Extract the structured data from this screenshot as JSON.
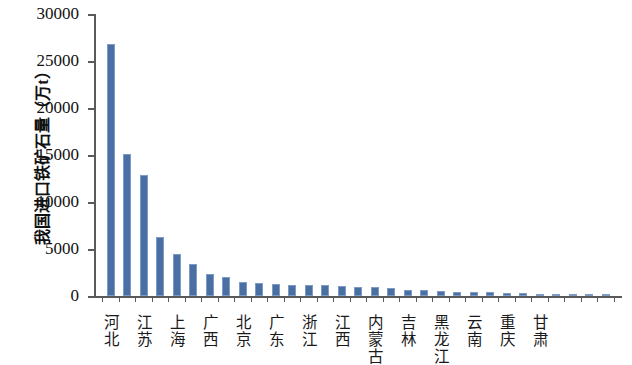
{
  "chart_data": {
    "type": "bar",
    "title": "",
    "xlabel": "",
    "ylabel": "我国进口铁矿石量（万t）",
    "ylim": [
      0,
      30000
    ],
    "ytick_values": [
      0,
      5000,
      10000,
      15000,
      20000,
      25000,
      30000
    ],
    "ytick_labels": [
      "0",
      "5000",
      "10000",
      "15000",
      "20000",
      "25000",
      "30000"
    ],
    "grid": false,
    "legend": null,
    "bar_color": "#4a6fa5",
    "bar_edge_color": "#7e9bc4",
    "axis_color": "#5a5a5a",
    "categories": [
      "河北",
      "辽宁",
      "江苏",
      "山东",
      "上海",
      "天津",
      "广西",
      "福建",
      "北京",
      "湖北",
      "广东",
      "安徽",
      "浙江",
      "山西",
      "江西",
      "河南",
      "内蒙古",
      "湖南",
      "吉林",
      "四川",
      "黑龙江",
      "陕西",
      "云南",
      "贵州",
      "重庆",
      "新疆",
      "甘肃",
      "宁夏",
      "青海",
      "海南",
      "西藏"
    ],
    "visible_xtick_labels": [
      "河北",
      "江苏",
      "上海",
      "广西",
      "北京",
      "广东",
      "浙江",
      "江西",
      "内蒙古",
      "吉林",
      "黑龙江",
      "云南",
      "重庆",
      "甘肃"
    ],
    "values": [
      26800,
      15100,
      12900,
      6300,
      4450,
      3400,
      2350,
      2050,
      1450,
      1380,
      1300,
      1200,
      1150,
      1120,
      1080,
      1000,
      950,
      820,
      640,
      600,
      560,
      480,
      430,
      400,
      330,
      300,
      260,
      220,
      180,
      140,
      110
    ]
  }
}
